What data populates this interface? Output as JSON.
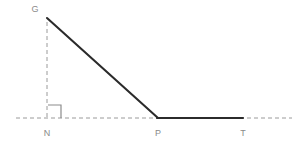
{
  "figure": {
    "kind": "geometry-diagram",
    "background_color": "#ffffff",
    "canvas": {
      "width": 304,
      "height": 147
    },
    "colors": {
      "solid_stroke": "#2b2b2b",
      "dashed_stroke": "#9a9a9a",
      "right_angle_marker": "#8c8c8c",
      "label_text": "#8a8a8a"
    },
    "points": [
      {
        "id": "G",
        "label": "G",
        "x": 47,
        "y": 18,
        "label_x": 35,
        "label_y": 12
      },
      {
        "id": "N",
        "label": "N",
        "x": 47,
        "y": 118,
        "label_x": 47,
        "label_y": 136
      },
      {
        "id": "P",
        "label": "P",
        "x": 158,
        "y": 118,
        "label_x": 158,
        "label_y": 136
      },
      {
        "id": "T",
        "label": "T",
        "x": 243,
        "y": 118,
        "label_x": 243,
        "label_y": 136
      }
    ],
    "segments": [
      {
        "id": "GP",
        "name": "hypotenuse-segment",
        "style": "solid",
        "from": [
          47,
          18
        ],
        "to": [
          158,
          118
        ]
      },
      {
        "id": "PT",
        "name": "base-segment",
        "style": "solid",
        "from": [
          158,
          118
        ],
        "to": [
          243,
          118
        ]
      },
      {
        "id": "GN",
        "name": "height-segment",
        "style": "dashed",
        "from": [
          47,
          22
        ],
        "to": [
          47,
          118
        ]
      },
      {
        "id": "baseline",
        "name": "baseline-axis",
        "style": "dashed",
        "from": [
          16,
          118
        ],
        "to": [
          292,
          118
        ]
      }
    ],
    "right_angle_marker": {
      "at": "N",
      "size": 13,
      "path": "M 48 105 L 61 105 L 61 118"
    }
  }
}
